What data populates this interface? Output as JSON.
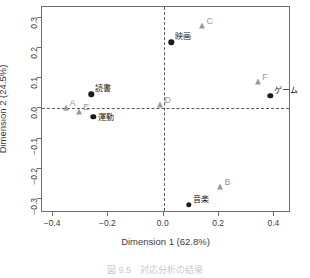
{
  "chart_data": {
    "type": "scatter",
    "title": "",
    "xlabel": "Dimension 1 (62.8%)",
    "ylabel": "Dimension 2 (24.5%)",
    "xlim": [
      -0.44,
      0.46
    ],
    "ylim": [
      -0.345,
      0.335
    ],
    "xticks": [
      -0.4,
      -0.2,
      0.0,
      0.2,
      0.4
    ],
    "xticklabels": [
      "−0.4",
      "−0.2",
      "0.0",
      "0.2",
      "0.4"
    ],
    "yticks": [
      -0.3,
      -0.2,
      -0.1,
      0.0,
      0.1,
      0.2,
      0.3
    ],
    "yticklabels": [
      "−0.3",
      "−0.2",
      "−0.1",
      "0.0",
      "0.1",
      "0.2",
      "0.3"
    ],
    "grid": false,
    "legend": "none",
    "reference_lines": {
      "vertical_x": 0.0,
      "horizontal_y": 0.0,
      "style": "dashed"
    },
    "series": [
      {
        "name": "rows",
        "marker": "circle",
        "color": "#1b1b1b",
        "points": [
          {
            "label": "読書",
            "x": -0.262,
            "y": 0.047,
            "label_pos": "top-right"
          },
          {
            "label": "運動",
            "x": -0.255,
            "y": -0.027,
            "label_pos": "right"
          },
          {
            "label": "映画",
            "x": 0.028,
            "y": 0.218,
            "label_pos": "top-right"
          },
          {
            "label": "ゲーム",
            "x": 0.385,
            "y": 0.042,
            "label_pos": "top-right"
          },
          {
            "label": "音楽",
            "x": 0.09,
            "y": -0.318,
            "label_pos": "top-right"
          }
        ]
      },
      {
        "name": "columns",
        "marker": "triangle",
        "color": "#9a9a9a",
        "points": [
          {
            "label": "A",
            "x": -0.355,
            "y": 0.002,
            "label_pos": "top-right"
          },
          {
            "label": "E",
            "x": -0.305,
            "y": -0.012,
            "label_pos": "top-right"
          },
          {
            "label": "D",
            "x": -0.012,
            "y": 0.012,
            "label_pos": "top-right"
          },
          {
            "label": "C",
            "x": 0.14,
            "y": 0.272,
            "label_pos": "top-right"
          },
          {
            "label": "F",
            "x": 0.342,
            "y": 0.086,
            "label_pos": "top-right"
          },
          {
            "label": "B",
            "x": 0.205,
            "y": -0.258,
            "label_pos": "top-right"
          }
        ]
      }
    ]
  },
  "caption": "図 9.5　対応分析の結果"
}
